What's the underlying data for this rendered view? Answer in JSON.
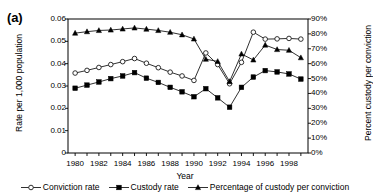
{
  "panel": {
    "label": "(a)"
  },
  "axes": {
    "xlabel": "Year",
    "ylabel_left": "Rate per 1,000 population",
    "ylabel_right": "Percent custody per conviction",
    "ytick_labels_left": [
      "0.06",
      "0.05",
      "0.04",
      "0.03",
      "0.02",
      "0.01",
      "0"
    ],
    "ytick_labels_right": [
      "90%",
      "80%",
      "70%",
      "60%",
      "50%",
      "40%",
      "30%",
      "20%",
      "10%",
      "0%"
    ],
    "xtick_labels": [
      "1980",
      "1982",
      "1984",
      "1986",
      "1988",
      "1990",
      "1992",
      "1994",
      "1996",
      "1998"
    ]
  },
  "legend": {
    "items": [
      {
        "label": "Conviction rate",
        "marker": "open-circle-marker"
      },
      {
        "label": "Custody rate",
        "marker": "filled-square-marker"
      },
      {
        "label": "Percentage of custody per conviction",
        "marker": "filled-triangle-marker"
      }
    ]
  },
  "chart_data": {
    "type": "line",
    "title": "",
    "subtitle": "",
    "xlabel": "Year",
    "ylabel": "Rate per 1,000 population",
    "ylabel_secondary": "Percent custody per conviction",
    "grid": false,
    "legend_position": "bottom",
    "x": [
      1980,
      1981,
      1982,
      1983,
      1984,
      1985,
      1986,
      1987,
      1988,
      1989,
      1990,
      1991,
      1992,
      1993,
      1994,
      1995,
      1996,
      1997,
      1998,
      1999
    ],
    "xtick_values": [
      1980,
      1982,
      1984,
      1986,
      1988,
      1990,
      1992,
      1994,
      1996,
      1998
    ],
    "xlim": [
      1979.4,
      1999.6
    ],
    "ylim": [
      0,
      0.06
    ],
    "ytick_values": [
      0,
      0.01,
      0.02,
      0.03,
      0.04,
      0.05,
      0.06
    ],
    "ylim_secondary": [
      0,
      90
    ],
    "ytick_values_secondary": [
      0,
      10,
      20,
      30,
      40,
      50,
      60,
      70,
      80,
      90
    ],
    "series": [
      {
        "name": "Conviction rate",
        "axis": "left",
        "units": "rate per 1,000 population",
        "marker": "open-circle",
        "values": [
          0.0358,
          0.037,
          0.0383,
          0.0396,
          0.0409,
          0.0423,
          0.0402,
          0.0382,
          0.0362,
          0.0345,
          0.0325,
          0.0448,
          0.0396,
          0.031,
          0.0406,
          0.0541,
          0.051,
          0.0511,
          0.0513,
          0.051
        ]
      },
      {
        "name": "Custody rate",
        "axis": "left",
        "units": "rate per 1,000 population",
        "marker": "filled-square",
        "values": [
          0.029,
          0.0304,
          0.0318,
          0.0333,
          0.0345,
          0.036,
          0.0335,
          0.0316,
          0.0294,
          0.0274,
          0.0252,
          0.0288,
          0.0247,
          0.0205,
          0.0294,
          0.034,
          0.0369,
          0.0363,
          0.0354,
          0.0331
        ]
      },
      {
        "name": "Percentage of custody per conviction",
        "axis": "right",
        "units": "percent",
        "marker": "filled-triangle",
        "values": [
          80.5,
          81.5,
          82.3,
          82.6,
          83.3,
          84.0,
          83.2,
          82.3,
          81.1,
          79.4,
          76.6,
          63.0,
          61.5,
          48.0,
          66.5,
          62.5,
          72.5,
          69.5,
          69.0,
          64.0
        ]
      }
    ]
  }
}
